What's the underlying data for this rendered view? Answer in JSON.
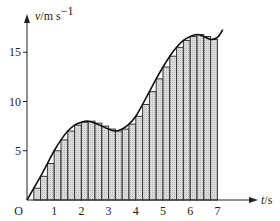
{
  "chart_data": {
    "type": "bar",
    "title": "",
    "xlabel": "t/s",
    "xlabel_var": "t",
    "xlabel_unit": "/s",
    "ylabel": "v/m s⁻¹",
    "ylabel_var": "v",
    "ylabel_unit": "/m s",
    "ylabel_exp": "−1",
    "origin_label": "O",
    "xlim": [
      0,
      7.6
    ],
    "ylim": [
      0,
      18.5
    ],
    "grid": false,
    "legend": "none",
    "x_ticks": [
      {
        "value": 1,
        "label": "1"
      },
      {
        "value": 2,
        "label": "2"
      },
      {
        "value": 3,
        "label": "3"
      },
      {
        "value": 4,
        "label": "4"
      },
      {
        "value": 5,
        "label": "5"
      },
      {
        "value": 6,
        "label": "6"
      },
      {
        "value": 7,
        "label": "7"
      }
    ],
    "y_ticks": [
      {
        "value": 5,
        "label": "5"
      },
      {
        "value": 10,
        "label": "10"
      },
      {
        "value": 15,
        "label": "15"
      }
    ],
    "bar_width": 0.25,
    "bars": {
      "x_start": [
        0,
        0.25,
        0.5,
        0.75,
        1,
        1.25,
        1.5,
        1.75,
        2,
        2.25,
        2.5,
        2.75,
        3,
        3.25,
        3.5,
        3.75,
        4,
        4.25,
        4.5,
        4.75,
        5,
        5.25,
        5.5,
        5.75,
        6,
        6.25,
        6.5,
        6.75
      ],
      "values": [
        0,
        1.2,
        2.4,
        3.7,
        5.0,
        6.1,
        7.0,
        7.6,
        7.9,
        8.0,
        7.8,
        7.5,
        7.2,
        7.0,
        7.2,
        7.7,
        8.5,
        9.7,
        11.0,
        12.3,
        13.5,
        14.6,
        15.5,
        16.2,
        16.6,
        16.8,
        16.6,
        16.3
      ]
    },
    "curve": {
      "name": "v(t)",
      "x": [
        0,
        0.25,
        0.5,
        0.75,
        1,
        1.25,
        1.5,
        1.75,
        2,
        2.25,
        2.5,
        2.75,
        3,
        3.25,
        3.5,
        3.75,
        4,
        4.25,
        4.5,
        4.75,
        5,
        5.25,
        5.5,
        5.75,
        6,
        6.25,
        6.5,
        6.75,
        7,
        7.2
      ],
      "y": [
        0,
        1.2,
        2.4,
        3.7,
        5.0,
        6.1,
        7.0,
        7.6,
        7.9,
        8.0,
        7.8,
        7.5,
        7.2,
        7.0,
        7.2,
        7.7,
        8.5,
        9.7,
        11.0,
        12.3,
        13.5,
        14.6,
        15.5,
        16.2,
        16.6,
        16.8,
        16.6,
        16.3,
        16.5,
        17.3
      ]
    },
    "colors": {
      "bar_fill": "#d4d4d4",
      "bar_stroke": "#333333",
      "curve": "#111111",
      "axis": "#222222"
    }
  }
}
